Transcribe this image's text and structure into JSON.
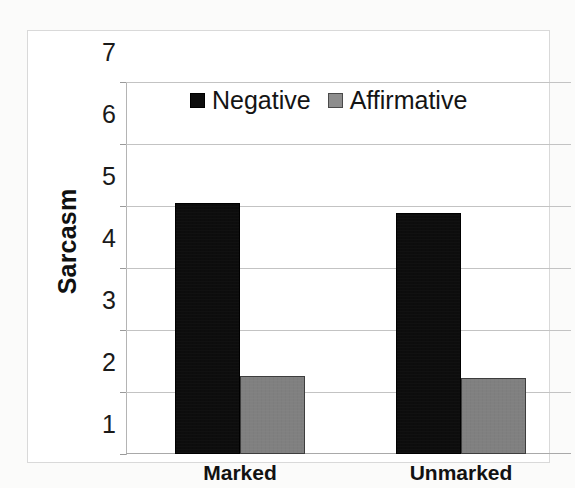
{
  "chart_data": {
    "type": "bar",
    "title": "",
    "subtitle": "",
    "xlabel": "",
    "ylabel": "Sarcasm",
    "categories": [
      "Marked",
      "Unmarked"
    ],
    "series": [
      {
        "name": "Negative",
        "color": "#0d0d0d",
        "values": [
          5.05,
          4.89
        ]
      },
      {
        "name": "Affirmative",
        "color": "#808080",
        "values": [
          2.26,
          2.23
        ]
      }
    ],
    "ylim": [
      1,
      7
    ],
    "yticks": [
      1,
      2,
      3,
      4,
      5,
      6,
      7
    ],
    "ytick_labels": [
      "1",
      "2",
      "3",
      "4",
      "5",
      "6",
      "7"
    ],
    "grid": "horizontal",
    "legend_position": "top-center",
    "legend_entries": [
      "Negative",
      "Affirmative"
    ],
    "annotations": []
  },
  "axis": {
    "y_title": "Sarcasm",
    "tick_7": "7",
    "tick_6": "6",
    "tick_5": "5",
    "tick_4": "4",
    "tick_3": "3",
    "tick_2": "2",
    "tick_1": "1"
  },
  "categories": {
    "first": "Marked",
    "second": "Unmarked"
  },
  "legend": {
    "negative_label": "Negative",
    "affirmative_label": "Affirmative"
  },
  "colors": {
    "negative": "#0d0d0d",
    "affirmative": "#808080",
    "gridline": "#c3c3c3",
    "frame": "#d9d9d9",
    "text": "#141414",
    "page": "#fbfbfa"
  }
}
